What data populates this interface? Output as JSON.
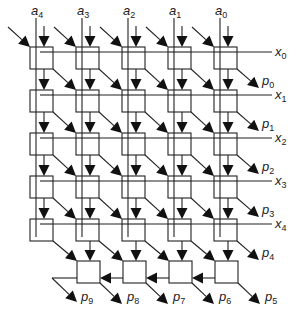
{
  "diagram": {
    "colors": {
      "stroke": "#222222",
      "background": "#ffffff",
      "arrow": "#111111"
    },
    "column_inputs": [
      {
        "name": "a",
        "sub": "4"
      },
      {
        "name": "a",
        "sub": "3"
      },
      {
        "name": "a",
        "sub": "2"
      },
      {
        "name": "a",
        "sub": "1"
      },
      {
        "name": "a",
        "sub": "0"
      }
    ],
    "row_inputs": [
      {
        "name": "x",
        "sub": "0"
      },
      {
        "name": "x",
        "sub": "1"
      },
      {
        "name": "x",
        "sub": "2"
      },
      {
        "name": "x",
        "sub": "3"
      },
      {
        "name": "x",
        "sub": "4"
      }
    ],
    "right_outputs": [
      {
        "name": "p",
        "sub": "0"
      },
      {
        "name": "p",
        "sub": "1"
      },
      {
        "name": "p",
        "sub": "2"
      },
      {
        "name": "p",
        "sub": "3"
      },
      {
        "name": "p",
        "sub": "4"
      }
    ],
    "bottom_outputs": [
      {
        "name": "p",
        "sub": "9"
      },
      {
        "name": "p",
        "sub": "8"
      },
      {
        "name": "p",
        "sub": "7"
      },
      {
        "name": "p",
        "sub": "6"
      },
      {
        "name": "p",
        "sub": "5"
      }
    ],
    "grid": {
      "rows": 5,
      "columns": 5,
      "final_adder_cells": 4
    }
  }
}
